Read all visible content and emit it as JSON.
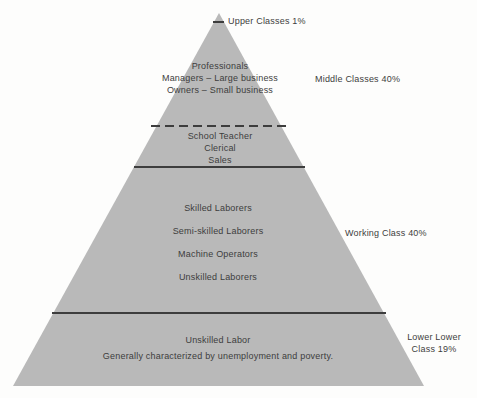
{
  "diagram": {
    "type": "social-class-pyramid",
    "colors": {
      "pyramid_fill": "#b9b9b9",
      "line_color": "#3d3d3d",
      "background": "#fdfdfc",
      "text_color": "#3d3d3d"
    },
    "upper": {
      "label": "Upper Classes 1%"
    },
    "middle": {
      "label": "Middle Classes 40%",
      "upper_items": {
        "0": "Professionals",
        "1": "Managers – Large business",
        "2": "Owners – Small business"
      },
      "lower_items": {
        "0": "School Teacher",
        "1": "Clerical",
        "2": "Sales"
      }
    },
    "working": {
      "label": "Working Class 40%",
      "items": {
        "0": "Skilled Laborers",
        "1": "Semi-skilled Laborers",
        "2": "Machine Operators",
        "3": "Unskilled Laborers"
      }
    },
    "lower": {
      "label_line1": "Lower Lower",
      "label_line2": "Class 19%",
      "items": {
        "0": "Unskilled Labor",
        "1": "Generally characterized by unemployment and poverty."
      }
    }
  }
}
